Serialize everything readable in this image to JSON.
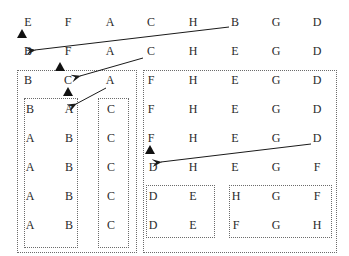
{
  "diagram": {
    "rows": {
      "row1": [
        "E",
        "F",
        "A",
        "C",
        "H",
        "B",
        "G",
        "D"
      ],
      "row2": [
        "B",
        "F",
        "A",
        "C",
        "H",
        "E",
        "G",
        "D"
      ]
    },
    "left_group": {
      "header": [
        "B",
        "C",
        "A"
      ],
      "inner_pairs": [
        [
          "B",
          "A"
        ],
        [
          "A",
          "B"
        ],
        [
          "A",
          "B"
        ],
        [
          "A",
          "B"
        ],
        [
          "A",
          "B"
        ]
      ],
      "inner_singles": [
        "C",
        "C",
        "C",
        "C",
        "C"
      ]
    },
    "right_group": {
      "rows": [
        [
          "F",
          "H",
          "E",
          "G",
          "D"
        ],
        [
          "F",
          "H",
          "E",
          "G",
          "D"
        ],
        [
          "F",
          "H",
          "E",
          "G",
          "D"
        ],
        [
          "D",
          "H",
          "E",
          "G",
          "F"
        ]
      ],
      "sub_box_left": [
        [
          "D",
          "E"
        ],
        [
          "D",
          "E"
        ]
      ],
      "sub_box_right": [
        [
          "H",
          "G",
          "F"
        ],
        [
          "F",
          "G",
          "H"
        ]
      ]
    },
    "colors": {
      "ink": "#2a2a2a",
      "box_border": "#6b6b6b",
      "arrow": "#1a1a1a"
    }
  }
}
